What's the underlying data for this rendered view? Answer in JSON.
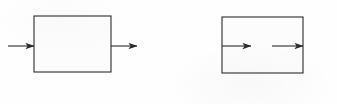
{
  "figure": {
    "caption": "Two block diagrams: a box with an external input arrow and external output arrow, and a box containing two internal arrows.",
    "background_color": "#fefefe",
    "stroke_color": "#2b2b2b",
    "fill_color": "#fcfcfc",
    "stroke_width": 1.1,
    "width": 337,
    "height": 104
  },
  "diagrams": [
    {
      "id": "left-diagram",
      "name": "box-with-external-arrows",
      "box": {
        "name": "left-box",
        "x": 34,
        "y": 16,
        "width": 77,
        "height": 56
      },
      "arrows": [
        {
          "name": "input-arrow",
          "role": "input",
          "x1": 8,
          "y1": 46,
          "x2": 34,
          "y2": 46,
          "direction": "right"
        },
        {
          "name": "output-arrow",
          "role": "output",
          "x1": 111,
          "y1": 46,
          "x2": 137,
          "y2": 46,
          "direction": "right"
        }
      ]
    },
    {
      "id": "right-diagram",
      "name": "box-with-internal-arrows",
      "box": {
        "name": "right-box",
        "x": 222,
        "y": 17,
        "width": 81,
        "height": 56
      },
      "arrows": [
        {
          "name": "internal-arrow-first",
          "role": "internal",
          "x1": 222,
          "y1": 46,
          "x2": 251,
          "y2": 46,
          "direction": "right"
        },
        {
          "name": "internal-arrow-second",
          "role": "internal",
          "x1": 272,
          "y1": 46,
          "x2": 303,
          "y2": 46,
          "direction": "right"
        }
      ]
    }
  ]
}
